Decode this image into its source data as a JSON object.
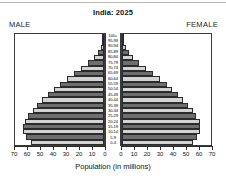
{
  "chart_data": {
    "type": "bar",
    "title": "India: 2025",
    "subtitle": "",
    "xlabel": "Population (in millions)",
    "ylabel": "",
    "left_panel_label": "MALE",
    "right_panel_label": "FEMALE",
    "orientation": "horizontal-diverging",
    "grid": false,
    "legend": "none",
    "xlim": [
      0,
      70
    ],
    "x_tick_values_left": [
      70,
      60,
      50,
      40,
      30,
      20,
      10,
      0
    ],
    "x_tick_values_right": [
      0,
      10,
      20,
      30,
      40,
      50,
      60,
      70
    ],
    "categories": [
      "100+",
      "95-99",
      "90-94",
      "85-89",
      "80-84",
      "75-79",
      "70-74",
      "65-69",
      "60-64",
      "55-59",
      "50-54",
      "45-49",
      "40-44",
      "35-39",
      "30-34",
      "25-29",
      "20-24",
      "15-19",
      "10-14",
      "5-9",
      "0-4"
    ],
    "series": [
      {
        "name": "MALE",
        "side": "left",
        "values": [
          0.2,
          0.9,
          2.3,
          4.6,
          8.0,
          12.5,
          18.0,
          24.0,
          29.5,
          34.5,
          39.5,
          44.0,
          48.5,
          52.5,
          56.0,
          59.5,
          62.5,
          63.5,
          64.0,
          61.0,
          57.5
        ]
      },
      {
        "name": "FEMALE",
        "side": "right",
        "values": [
          0.3,
          1.2,
          2.9,
          5.4,
          9.0,
          13.5,
          19.0,
          24.5,
          30.0,
          35.0,
          39.5,
          44.0,
          48.0,
          52.0,
          55.5,
          58.5,
          61.0,
          61.5,
          61.5,
          59.0,
          55.5
        ]
      }
    ],
    "bar_shading_sequence": [
      "lt",
      "dk"
    ],
    "colors": {
      "bar_light": "#d3d3d3",
      "bar_dark": "#6e6e6e",
      "bar_outline": "#2b2b2b",
      "frame": "#3a3a3a",
      "text": "#111111",
      "background": "#ffffff"
    }
  }
}
